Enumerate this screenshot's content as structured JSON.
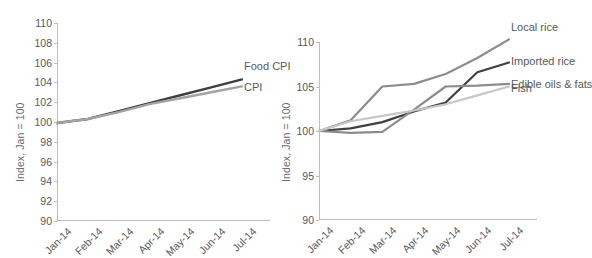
{
  "figure": {
    "cropped_title_fragment": "",
    "panels": [
      {
        "id": "left",
        "ylabel": "Index, Jan = 100",
        "yticks": [
          "110",
          "108",
          "106",
          "104",
          "102",
          "100",
          "98",
          "96",
          "94",
          "92",
          "90"
        ],
        "xticks": [
          "Jan-14",
          "Feb-14",
          "Mar-14",
          "Apr-14",
          "May-14",
          "Jun-14",
          "Jul-14"
        ],
        "series_labels": [
          "Food CPI",
          "CPI"
        ]
      },
      {
        "id": "right",
        "ylabel": "Index, Jan = 100",
        "yticks": [
          "110",
          "105",
          "100",
          "95",
          "90"
        ],
        "xticks": [
          "Jan-14",
          "Feb-14",
          "Mar-14",
          "Apr-14",
          "May-14",
          "Jun-14",
          "Jul-14"
        ],
        "series_labels": [
          "Local rice",
          "Imported rice",
          "Edible oils & fats",
          "Fish"
        ]
      }
    ]
  },
  "colors": {
    "dark": "#3f3f3f",
    "mid_gray": "#8c8c8c",
    "gray": "#a3a3a3",
    "light_gray": "#c7c7c7",
    "axis": "#bcbec0",
    "text": "#58595b"
  },
  "chart_data": [
    {
      "type": "line",
      "id": "consumer-price-index",
      "title": "",
      "xlabel": "",
      "ylabel": "Index, Jan = 100",
      "categories": [
        "Jan-14",
        "Feb-14",
        "Mar-14",
        "Apr-14",
        "May-14",
        "Jun-14",
        "Jul-14"
      ],
      "ylim": [
        90,
        110
      ],
      "ytick_step": 2,
      "grid": false,
      "legend": "inline-right",
      "series": [
        {
          "name": "Food CPI",
          "color": "#3f3f3f",
          "values": [
            99.9,
            100.3,
            101.1,
            101.9,
            102.7,
            103.5,
            104.3
          ]
        },
        {
          "name": "CPI",
          "color": "#a3a3a3",
          "values": [
            99.9,
            100.3,
            101.0,
            101.8,
            102.4,
            103.0,
            103.6
          ]
        }
      ]
    },
    {
      "type": "line",
      "id": "food-item-prices",
      "title": "",
      "xlabel": "",
      "ylabel": "Index, Jan = 100",
      "categories": [
        "Jan-14",
        "Feb-14",
        "Mar-14",
        "Apr-14",
        "May-14",
        "Jun-14",
        "Jul-14"
      ],
      "ylim": [
        90,
        110
      ],
      "ytick_step": 5,
      "grid": false,
      "legend": "inline-right",
      "series": [
        {
          "name": "Local rice",
          "color": "#8c8c8c",
          "values": [
            100.0,
            101.2,
            105.0,
            105.3,
            106.4,
            108.2,
            110.3
          ]
        },
        {
          "name": "Imported rice",
          "color": "#3f3f3f",
          "values": [
            100.0,
            100.3,
            101.0,
            102.2,
            103.2,
            106.6,
            107.7
          ]
        },
        {
          "name": "Edible oils & fats",
          "color": "#8c8c8c",
          "values": [
            100.0,
            99.8,
            99.9,
            102.4,
            105.0,
            105.1,
            105.3
          ]
        },
        {
          "name": "Fish",
          "color": "#c7c7c7",
          "values": [
            100.0,
            101.1,
            101.7,
            102.3,
            103.0,
            104.0,
            105.0
          ]
        }
      ]
    }
  ]
}
